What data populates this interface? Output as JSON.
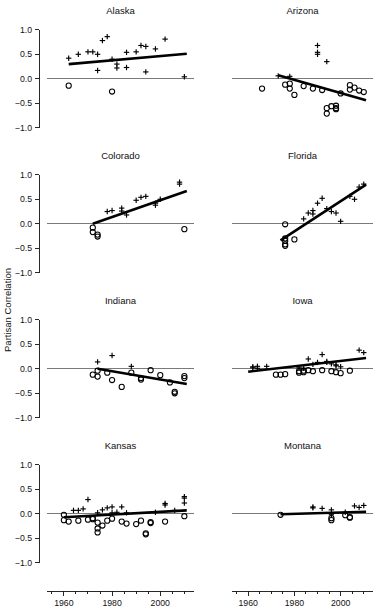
{
  "figure": {
    "ylabel": "Partisan Correlation",
    "panel_cols": 2,
    "panel_rows": 4
  },
  "chart_data": {
    "type": "scatter",
    "title": "",
    "subtitle": "",
    "xlabel": "",
    "ylabel": "Partisan Correlation",
    "xlim": [
      1953,
      2014
    ],
    "ylim": [
      -1.25,
      1.2
    ],
    "yticks": [
      1.0,
      0.5,
      0.0,
      -0.5,
      -1.0
    ],
    "ytick_labels": [
      "1.0",
      "0.5",
      "0.0",
      "-0.5",
      "-1.0"
    ],
    "xticks": [
      1960,
      1980,
      2000
    ],
    "xtick_labels": [
      "1960",
      "1980",
      "2000"
    ],
    "x_minor_tick_step": 5,
    "grid": false,
    "legend": "none",
    "marker_series": [
      {
        "name": "plus",
        "symbol": "+",
        "description": "plus marker series"
      },
      {
        "name": "circle",
        "symbol": "o",
        "description": "open circle marker series"
      }
    ],
    "zero_reference_line": 0.0,
    "panels": [
      {
        "title": "Alaska",
        "row": 0,
        "col": 0,
        "fit_line": {
          "x0": 1962,
          "y0": 0.3,
          "x1": 2011,
          "y1": 0.51
        },
        "plus_points": [
          [
            1962,
            0.42
          ],
          [
            1966,
            0.5
          ],
          [
            1970,
            0.55
          ],
          [
            1972,
            0.55
          ],
          [
            1974,
            0.5
          ],
          [
            1976,
            0.78
          ],
          [
            1978,
            0.86
          ],
          [
            1974,
            0.17
          ],
          [
            1980,
            0.4
          ],
          [
            1982,
            0.3
          ],
          [
            1982,
            0.22
          ],
          [
            1986,
            0.23
          ],
          [
            1986,
            0.54
          ],
          [
            1990,
            0.55
          ],
          [
            1992,
            0.68
          ],
          [
            1994,
            0.66
          ],
          [
            1994,
            0.14
          ],
          [
            1998,
            0.61
          ],
          [
            2002,
            0.81
          ],
          [
            2010,
            0.04
          ]
        ],
        "circle_points": [
          [
            1962,
            -0.14
          ],
          [
            1980,
            -0.26
          ]
        ]
      },
      {
        "title": "Arizona",
        "row": 0,
        "col": 1,
        "fit_line": {
          "x0": 1973,
          "y0": 0.07,
          "x1": 2011,
          "y1": -0.44
        },
        "plus_points": [
          [
            1973,
            0.06
          ],
          [
            1978,
            0.05
          ],
          [
            1990,
            0.68
          ],
          [
            1990,
            0.54
          ],
          [
            1990,
            0.5
          ],
          [
            1994,
            0.35
          ]
        ],
        "circle_points": [
          [
            1966,
            -0.2
          ],
          [
            1976,
            -0.12
          ],
          [
            1978,
            -0.1
          ],
          [
            1978,
            -0.2
          ],
          [
            1980,
            -0.33
          ],
          [
            1984,
            -0.15
          ],
          [
            1988,
            -0.2
          ],
          [
            1992,
            -0.23
          ],
          [
            1994,
            -0.6
          ],
          [
            1994,
            -0.71
          ],
          [
            1996,
            -0.56
          ],
          [
            1998,
            -0.55
          ],
          [
            1998,
            -0.6
          ],
          [
            1998,
            -0.62
          ],
          [
            2000,
            -0.3
          ],
          [
            2004,
            -0.13
          ],
          [
            2004,
            -0.22
          ],
          [
            2006,
            -0.18
          ],
          [
            2008,
            -0.24
          ],
          [
            2010,
            -0.27
          ]
        ]
      },
      {
        "title": "Colorado",
        "row": 1,
        "col": 0,
        "fit_line": {
          "x0": 1972,
          "y0": 0.0,
          "x1": 2011,
          "y1": 0.67
        },
        "plus_points": [
          [
            1978,
            0.25
          ],
          [
            1980,
            0.27
          ],
          [
            1984,
            0.32
          ],
          [
            1984,
            0.26
          ],
          [
            1986,
            0.18
          ],
          [
            1990,
            0.48
          ],
          [
            1992,
            0.54
          ],
          [
            1994,
            0.56
          ],
          [
            1998,
            0.38
          ],
          [
            1998,
            0.42
          ],
          [
            2000,
            0.5
          ],
          [
            2008,
            0.85
          ],
          [
            2008,
            0.81
          ]
        ],
        "circle_points": [
          [
            1972,
            -0.08
          ],
          [
            1972,
            -0.17
          ],
          [
            1974,
            -0.22
          ],
          [
            1974,
            -0.26
          ],
          [
            2010,
            -0.11
          ]
        ]
      },
      {
        "title": "Florida",
        "row": 1,
        "col": 1,
        "fit_line": {
          "x0": 1974,
          "y0": -0.34,
          "x1": 2011,
          "y1": 0.8
        },
        "plus_points": [
          [
            1984,
            0.1
          ],
          [
            1986,
            0.22
          ],
          [
            1988,
            0.27
          ],
          [
            1988,
            0.2
          ],
          [
            1990,
            0.42
          ],
          [
            1992,
            0.52
          ],
          [
            1994,
            0.31
          ],
          [
            1996,
            0.25
          ],
          [
            1998,
            0.22
          ],
          [
            2000,
            0.05
          ],
          [
            2004,
            0.56
          ],
          [
            2006,
            0.5
          ],
          [
            2008,
            0.75
          ],
          [
            2010,
            0.81
          ]
        ],
        "circle_points": [
          [
            1976,
            -0.01
          ],
          [
            1976,
            -0.3
          ],
          [
            1976,
            -0.35
          ],
          [
            1976,
            -0.42
          ],
          [
            1976,
            -0.45
          ],
          [
            1980,
            -0.32
          ]
        ]
      },
      {
        "title": "Indiana",
        "row": 2,
        "col": 0,
        "fit_line": {
          "x0": 1974,
          "y0": 0.0,
          "x1": 2011,
          "y1": -0.31
        },
        "plus_points": [
          [
            1974,
            0.14
          ],
          [
            1980,
            0.27
          ],
          [
            1988,
            0.05
          ]
        ],
        "circle_points": [
          [
            1972,
            -0.12
          ],
          [
            1974,
            -0.04
          ],
          [
            1974,
            -0.16
          ],
          [
            1978,
            -0.08
          ],
          [
            1980,
            -0.23
          ],
          [
            1984,
            -0.37
          ],
          [
            1988,
            -0.08
          ],
          [
            1992,
            -0.19
          ],
          [
            1992,
            -0.22
          ],
          [
            1996,
            -0.03
          ],
          [
            2000,
            -0.13
          ],
          [
            2004,
            -0.28
          ],
          [
            2006,
            -0.47
          ],
          [
            2006,
            -0.5
          ],
          [
            2010,
            -0.15
          ],
          [
            2010,
            -0.19
          ]
        ]
      },
      {
        "title": "Iowa",
        "row": 2,
        "col": 1,
        "fit_line": {
          "x0": 1960,
          "y0": -0.06,
          "x1": 2011,
          "y1": 0.22
        },
        "plus_points": [
          [
            1962,
            0.04
          ],
          [
            1962,
            0.02
          ],
          [
            1964,
            0.05
          ],
          [
            1964,
            0.01
          ],
          [
            1968,
            0.05
          ],
          [
            1982,
            0.02
          ],
          [
            1984,
            0.01
          ],
          [
            1986,
            0.2
          ],
          [
            1988,
            0.09
          ],
          [
            1990,
            0.13
          ],
          [
            1992,
            0.29
          ],
          [
            1994,
            0.13
          ],
          [
            1994,
            0.15
          ],
          [
            1996,
            0.1
          ],
          [
            1998,
            0.06
          ],
          [
            1998,
            0.08
          ],
          [
            2000,
            0.04
          ],
          [
            2008,
            0.38
          ],
          [
            2010,
            0.33
          ]
        ],
        "circle_points": [
          [
            1972,
            -0.12
          ],
          [
            1974,
            -0.12
          ],
          [
            1976,
            -0.11
          ],
          [
            1982,
            -0.05
          ],
          [
            1982,
            -0.08
          ],
          [
            1984,
            -0.04
          ],
          [
            1984,
            -0.07
          ],
          [
            1986,
            -0.03
          ],
          [
            1988,
            -0.05
          ],
          [
            1992,
            -0.03
          ],
          [
            1996,
            -0.05
          ],
          [
            1998,
            -0.07
          ],
          [
            2000,
            -0.09
          ],
          [
            2004,
            -0.04
          ]
        ]
      },
      {
        "title": "Kansas",
        "row": 3,
        "col": 0,
        "fit_line": {
          "x0": 1960,
          "y0": -0.07,
          "x1": 2011,
          "y1": 0.07
        },
        "plus_points": [
          [
            1964,
            0.07
          ],
          [
            1966,
            0.07
          ],
          [
            1968,
            0.1
          ],
          [
            1970,
            0.29
          ],
          [
            1974,
            0.02
          ],
          [
            1976,
            0.08
          ],
          [
            1978,
            0.12
          ],
          [
            1980,
            0.14
          ],
          [
            1980,
            0.02
          ],
          [
            1982,
            0.03
          ],
          [
            1984,
            0.14
          ],
          [
            1986,
            0.02
          ],
          [
            1998,
            0.03
          ],
          [
            2002,
            0.21
          ],
          [
            2002,
            0.18
          ],
          [
            2006,
            0.07
          ],
          [
            2010,
            0.35
          ],
          [
            2010,
            0.32
          ],
          [
            2010,
            0.22
          ]
        ],
        "circle_points": [
          [
            1960,
            -0.02
          ],
          [
            1960,
            -0.13
          ],
          [
            1962,
            -0.16
          ],
          [
            1966,
            -0.14
          ],
          [
            1970,
            -0.12
          ],
          [
            1972,
            -0.09
          ],
          [
            1972,
            -0.11
          ],
          [
            1974,
            -0.18
          ],
          [
            1974,
            -0.3
          ],
          [
            1974,
            -0.38
          ],
          [
            1976,
            -0.24
          ],
          [
            1978,
            -0.14
          ],
          [
            1980,
            -0.1
          ],
          [
            1984,
            -0.16
          ],
          [
            1986,
            -0.2
          ],
          [
            1990,
            -0.21
          ],
          [
            1992,
            -0.14
          ],
          [
            1994,
            -0.42
          ],
          [
            1994,
            -0.4
          ],
          [
            1996,
            -0.17
          ],
          [
            1996,
            -0.19
          ],
          [
            2002,
            -0.16
          ],
          [
            2010,
            -0.05
          ]
        ]
      },
      {
        "title": "Montana",
        "row": 3,
        "col": 1,
        "fit_line": {
          "x0": 1974,
          "y0": -0.01,
          "x1": 2011,
          "y1": 0.04
        },
        "plus_points": [
          [
            1988,
            0.14
          ],
          [
            1988,
            0.12
          ],
          [
            1992,
            0.11
          ],
          [
            1996,
            0.08
          ],
          [
            1996,
            -0.02
          ],
          [
            2002,
            0.03
          ],
          [
            2006,
            0.16
          ],
          [
            2008,
            0.13
          ],
          [
            2010,
            0.17
          ]
        ],
        "circle_points": [
          [
            1974,
            -0.02
          ],
          [
            1996,
            -0.09
          ],
          [
            1996,
            -0.13
          ],
          [
            2002,
            -0.03
          ],
          [
            2004,
            -0.07
          ],
          [
            2004,
            -0.08
          ]
        ]
      }
    ]
  }
}
